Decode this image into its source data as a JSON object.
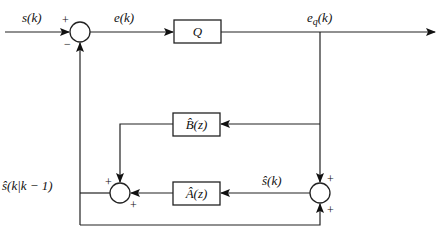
{
  "diagram": {
    "type": "block-diagram",
    "signals": {
      "input": "s(k)",
      "error": "e(k)",
      "quantized_error": "e",
      "quantized_error_sub": "q",
      "quantized_error_arg": "(k)",
      "estimate": "ŝ(k)",
      "prediction": "ŝ(k|k − 1)"
    },
    "blocks": {
      "quantizer": "Q",
      "b_filter": "B̂(z)",
      "a_filter": "Â(z)"
    },
    "summers": {
      "top": {
        "in_left": "+",
        "in_bottom": "−"
      },
      "lower_left": {
        "in_top": "+",
        "in_right": "+"
      },
      "lower_right": {
        "in_top": "+",
        "in_bottom": "+"
      }
    },
    "colors": {
      "line": "#222222",
      "background": "#ffffff"
    }
  }
}
